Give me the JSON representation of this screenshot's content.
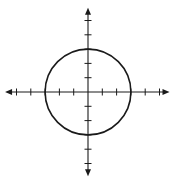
{
  "diagram": {
    "type": "coordinate-plane-circle",
    "colors": {
      "background": "#ffffff",
      "stroke": "#1a1a1a"
    },
    "axes": {
      "origin_px": [
        88,
        92
      ],
      "unit_px": 14.3,
      "x_ticks": [
        -5,
        -4,
        -3,
        -2,
        -1,
        1,
        2,
        3,
        4,
        5
      ],
      "y_ticks": [
        -5,
        -4,
        -3,
        -2,
        -1,
        1,
        2,
        3,
        4,
        5
      ],
      "x_range": [
        -5.8,
        5.7
      ],
      "y_range": [
        -5.9,
        5.9
      ],
      "arrows": true,
      "labels_shown": false
    },
    "circle": {
      "center": [
        0,
        0
      ],
      "radius": 3
    }
  }
}
